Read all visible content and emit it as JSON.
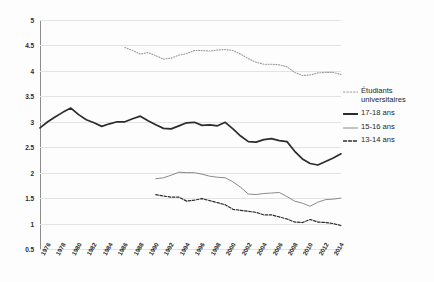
{
  "chart_data": {
    "type": "line",
    "title": "",
    "xlabel": "",
    "ylabel": "",
    "xlim": [
      1976,
      2015
    ],
    "ylim": [
      0.5,
      5
    ],
    "grid": true,
    "legend_position": "right",
    "y_ticks": [
      "0.5",
      "1",
      "1.5",
      "2",
      "2.5",
      "3",
      "3.5",
      "4",
      "4.5",
      "5"
    ],
    "y_tick_values": [
      0.5,
      1,
      1.5,
      2,
      2.5,
      3,
      3.5,
      4,
      4.5,
      5
    ],
    "x_ticks": [
      "1976",
      "1978",
      "1980",
      "1982",
      "1984",
      "1986",
      "1988",
      "1990",
      "1992",
      "1994",
      "1996",
      "1998",
      "2000",
      "2002",
      "2004",
      "2006",
      "2008",
      "2010",
      "2012",
      "2014"
    ],
    "x_tick_values": [
      1976,
      1978,
      1980,
      1982,
      1984,
      1986,
      1988,
      1990,
      1992,
      1994,
      1996,
      1998,
      2000,
      2002,
      2004,
      2006,
      2008,
      2010,
      2012,
      2014
    ],
    "series": [
      {
        "name": "Étudiants universitaires",
        "style": "dotted",
        "color": "#9a9a9a",
        "width": 1.1,
        "x": [
          1987,
          1988,
          1989,
          1990,
          1991,
          1992,
          1993,
          1994,
          1995,
          1996,
          1997,
          1998,
          1999,
          2000,
          2001,
          2002,
          2003,
          2004,
          2005,
          2006,
          2007,
          2008,
          2009,
          2010,
          2011,
          2012,
          2013,
          2014,
          2015
        ],
        "values": [
          4.46,
          4.4,
          4.33,
          4.36,
          4.3,
          4.23,
          4.25,
          4.31,
          4.34,
          4.4,
          4.4,
          4.39,
          4.41,
          4.42,
          4.4,
          4.33,
          4.24,
          4.17,
          4.13,
          4.13,
          4.12,
          4.08,
          3.97,
          3.91,
          3.92,
          3.96,
          3.97,
          3.97,
          3.93
        ]
      },
      {
        "name": "17-18 ans",
        "style": "solid-thick",
        "color": "#2c2c2c",
        "width": 1.7,
        "x": [
          1976,
          1977,
          1978,
          1979,
          1980,
          1981,
          1982,
          1983,
          1984,
          1985,
          1986,
          1987,
          1988,
          1989,
          1990,
          1991,
          1992,
          1993,
          1994,
          1995,
          1996,
          1997,
          1998,
          1999,
          2000,
          2001,
          2002,
          2003,
          2004,
          2005,
          2006,
          2007,
          2008,
          2009,
          2010,
          2011,
          2012,
          2013,
          2014,
          2015
        ],
        "values": [
          2.88,
          3.0,
          3.1,
          3.19,
          3.27,
          3.14,
          3.04,
          2.98,
          2.91,
          2.96,
          3.0,
          3.0,
          3.06,
          3.11,
          3.02,
          2.94,
          2.87,
          2.86,
          2.92,
          2.98,
          2.99,
          2.93,
          2.94,
          2.92,
          2.99,
          2.86,
          2.72,
          2.61,
          2.6,
          2.65,
          2.67,
          2.63,
          2.61,
          2.42,
          2.27,
          2.18,
          2.15,
          2.22,
          2.29,
          2.37
        ]
      },
      {
        "name": "15-16 ans",
        "style": "solid-thin",
        "color": "#8a8a8a",
        "width": 1.0,
        "x": [
          1991,
          1992,
          1993,
          1994,
          1995,
          1996,
          1997,
          1998,
          1999,
          2000,
          2001,
          2002,
          2003,
          2004,
          2005,
          2006,
          2007,
          2008,
          2009,
          2010,
          2011,
          2012,
          2013,
          2014,
          2015
        ],
        "values": [
          1.88,
          1.9,
          1.95,
          2.01,
          2.0,
          2.0,
          1.97,
          1.93,
          1.91,
          1.9,
          1.82,
          1.71,
          1.58,
          1.57,
          1.59,
          1.6,
          1.61,
          1.53,
          1.44,
          1.4,
          1.34,
          1.42,
          1.47,
          1.48,
          1.5
        ]
      },
      {
        "name": "13-14 ans",
        "style": "dashed",
        "color": "#2c2c2c",
        "width": 1.2,
        "x": [
          1991,
          1992,
          1993,
          1994,
          1995,
          1996,
          1997,
          1998,
          1999,
          2000,
          2001,
          2002,
          2003,
          2004,
          2005,
          2006,
          2007,
          2008,
          2009,
          2010,
          2011,
          2012,
          2013,
          2014,
          2015
        ],
        "values": [
          1.57,
          1.54,
          1.52,
          1.52,
          1.44,
          1.46,
          1.49,
          1.45,
          1.41,
          1.37,
          1.28,
          1.26,
          1.24,
          1.22,
          1.17,
          1.17,
          1.13,
          1.09,
          1.03,
          1.02,
          1.08,
          1.03,
          1.02,
          1.0,
          0.96
        ]
      }
    ]
  },
  "legend": {
    "items": [
      {
        "label": "Étudiants universitaires",
        "style": "dotted",
        "color": "#9a9a9a"
      },
      {
        "label": "17-18 ans",
        "style": "solid-thick",
        "color": "#2c2c2c"
      },
      {
        "label": "15-16 ans",
        "style": "solid-thin",
        "color": "#8a8a8a"
      },
      {
        "label": "13-14 ans",
        "style": "dashed",
        "color": "#2c2c2c"
      }
    ]
  }
}
